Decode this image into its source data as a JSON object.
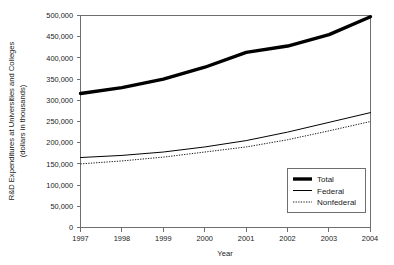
{
  "chart_data": {
    "type": "line",
    "title": "",
    "xlabel": "Year",
    "ylabel": "R&D Expenditures at Universities and Colleges (dollars in thousands)",
    "ylabel_line1": "R&D Expenditures at Universities and Colleges",
    "ylabel_line2": "(dollars in thousands)",
    "categories": [
      "1997",
      "1998",
      "1999",
      "2000",
      "2001",
      "2002",
      "2003",
      "2004"
    ],
    "x": [
      1997,
      1998,
      1999,
      2000,
      2001,
      2002,
      2003,
      2004
    ],
    "xlim": [
      1997,
      2004
    ],
    "ylim": [
      0,
      500000
    ],
    "ytick_values": [
      0,
      50000,
      100000,
      150000,
      200000,
      250000,
      300000,
      350000,
      400000,
      450000,
      500000
    ],
    "ytick_labels": [
      "0",
      "50,000",
      "100,000",
      "150,000",
      "200,000",
      "250,000",
      "300,000",
      "350,000",
      "400,000",
      "450,000",
      "500,000"
    ],
    "grid": false,
    "legend_position": "lower-right",
    "series": [
      {
        "name": "Total",
        "style": "thick-solid",
        "values": [
          316000,
          330000,
          350000,
          378000,
          413000,
          428000,
          455000,
          497000
        ]
      },
      {
        "name": "Federal",
        "style": "thin-solid",
        "values": [
          165000,
          170000,
          178000,
          190000,
          205000,
          225000,
          248000,
          271000
        ]
      },
      {
        "name": "Nonfederal",
        "style": "dotted",
        "values": [
          150000,
          157000,
          166000,
          178000,
          190000,
          207000,
          228000,
          250000
        ]
      }
    ],
    "legend": [
      {
        "label": "Total",
        "style": "thick-solid"
      },
      {
        "label": "Federal",
        "style": "thin-solid"
      },
      {
        "label": "Nonfederal",
        "style": "dotted"
      }
    ]
  }
}
